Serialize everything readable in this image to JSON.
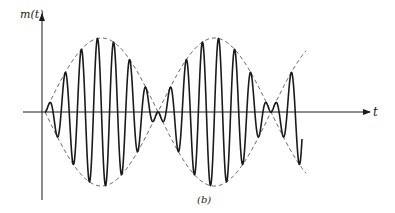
{
  "figure": {
    "y_axis_label": "m(t)",
    "x_axis_label": "t",
    "caption": "(b)"
  },
  "chart_data": {
    "type": "line",
    "title": "",
    "xlabel": "t",
    "ylabel": "m(t)",
    "grid": false,
    "legend": null,
    "series": [
      {
        "name": "m(t) carrier (solid)",
        "style": "solid",
        "envelope_lobes": 2.3,
        "carrier_cycles_per_lobe": 7
      },
      {
        "name": "envelope (dashed)",
        "style": "dashed",
        "shape": "±|sin|",
        "node_positions_px": [
          45,
          157,
          270
        ],
        "peak_positions_px": [
          100,
          213
        ]
      }
    ],
    "colors": {
      "ink": "#1a1a1a",
      "background": "#ffffff"
    }
  }
}
